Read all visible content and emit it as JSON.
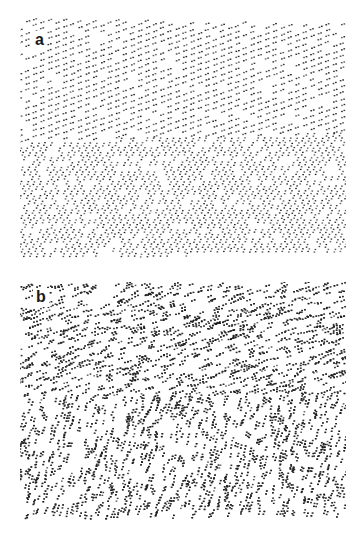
{
  "figure": {
    "background": "#ffffff",
    "ink_color": "#1e1e1e",
    "panels": [
      {
        "id": "a",
        "label": "a",
        "description": "Regular oriented texture: upper region with shallow-angle elements, lower region with steep-angle elements",
        "box": {
          "x": 20,
          "y": 18,
          "width": 326,
          "height": 242
        },
        "label_pos": {
          "x": 32,
          "y": 31
        },
        "top_edge": {
          "left_y": 18,
          "right_y": 24
        },
        "bottom_edge": {
          "left_y": 258,
          "right_y": 252
        },
        "boundary": {
          "left_y": 142,
          "right_y": 134
        },
        "layout": "regular",
        "upper_region": {
          "element_angle_deg": -20,
          "row_spacing": 6.2,
          "col_spacing": 7.5,
          "line_angle_deg": -20
        },
        "lower_region": {
          "element_angle_deg": -68,
          "row_spacing": 6.0,
          "col_spacing": 6.5,
          "line_angle_deg": -68
        }
      },
      {
        "id": "b",
        "label": "b",
        "description": "Random texture of dot pairs: upper region pairs near-horizontal, lower region pairs near-vertical",
        "box": {
          "x": 20,
          "y": 282,
          "width": 326,
          "height": 238
        },
        "label_pos": {
          "x": 33,
          "y": 288
        },
        "top_edge": {
          "left_y": 284,
          "right_y": 280
        },
        "bottom_edge": {
          "left_y": 518,
          "right_y": 516
        },
        "boundary": {
          "left_y": 396,
          "right_y": 394
        },
        "layout": "random",
        "density": 0.052,
        "upper_region": {
          "element_angle_deg": -20
        },
        "lower_region": {
          "element_angle_deg": -72
        }
      }
    ]
  }
}
